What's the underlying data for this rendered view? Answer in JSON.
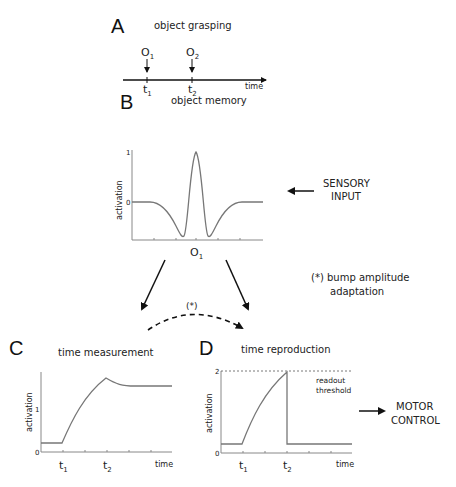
{
  "panel_a": {
    "letter": "A",
    "title": "object grasping",
    "events": [
      {
        "label": "O",
        "sub": "1",
        "time_label": "t",
        "time_sub": "1"
      },
      {
        "label": "O",
        "sub": "2",
        "time_label": "t",
        "time_sub": "2"
      }
    ],
    "axis_label": "time"
  },
  "panel_b": {
    "letter": "B",
    "title": "object memory",
    "ylabel": "activation",
    "yticks": [
      "1",
      "0"
    ],
    "xlabel": "O",
    "xlabel_sub": "1"
  },
  "sensory": {
    "line1": "SENSORY",
    "line2": "INPUT"
  },
  "adaptation": {
    "marker": "(*)",
    "line1": "(*) bump amplitude",
    "line2": "adaptation"
  },
  "panel_c": {
    "letter": "C",
    "title": "time measurement",
    "ylabel": "activation",
    "yticks": [
      "1",
      "0"
    ],
    "xticks": [
      {
        "t": "t",
        "sub": "1"
      },
      {
        "t": "t",
        "sub": "2"
      }
    ],
    "axis_label": "time"
  },
  "panel_d": {
    "letter": "D",
    "title": "time reproduction",
    "ylabel": "activation",
    "yticks": [
      "2",
      "0"
    ],
    "threshold_line1": "readout",
    "threshold_line2": "threshold",
    "xticks": [
      {
        "t": "t",
        "sub": "1"
      },
      {
        "t": "t",
        "sub": "2"
      }
    ],
    "axis_label": "time"
  },
  "motor": {
    "line1": "MOTOR",
    "line2": "CONTROL"
  },
  "colors": {
    "curve": "#777777",
    "axis": "#888888",
    "arrow": "#111111"
  }
}
